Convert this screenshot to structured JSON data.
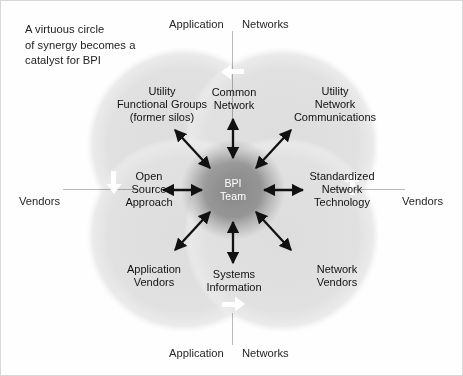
{
  "figure": {
    "caption_lines": [
      "A virtuous circle",
      "of synergy becomes a",
      "catalyst for BPI"
    ],
    "center": {
      "line1": "BPI",
      "line2": "Team"
    },
    "axis_labels": {
      "top_left": "Application",
      "top_right": "Networks",
      "bottom_left": "Application",
      "bottom_right": "Networks",
      "left": "Vendors",
      "right": "Vendors"
    },
    "nodes": [
      {
        "id": "utility-functional-groups",
        "lines": [
          "Utility",
          "Functional Groups",
          "(former silos)"
        ]
      },
      {
        "id": "common-network",
        "lines": [
          "Common",
          "Network"
        ]
      },
      {
        "id": "utility-network-communications",
        "lines": [
          "Utility",
          "Network",
          "Communications"
        ]
      },
      {
        "id": "open-source-approach",
        "lines": [
          "Open",
          "Source",
          "Approach"
        ]
      },
      {
        "id": "standardized-network-technology",
        "lines": [
          "Standardized",
          "Network",
          "Technology"
        ]
      },
      {
        "id": "application-vendors",
        "lines": [
          "Application",
          "Vendors"
        ]
      },
      {
        "id": "systems-information",
        "lines": [
          "Systems",
          "Information"
        ]
      },
      {
        "id": "network-vendors",
        "lines": [
          "Network",
          "Vendors"
        ]
      }
    ],
    "circulation_arrows": [
      {
        "id": "top",
        "direction": "left"
      },
      {
        "id": "right",
        "direction": "up"
      },
      {
        "id": "bottom",
        "direction": "right"
      },
      {
        "id": "left",
        "direction": "down"
      }
    ],
    "colors": {
      "background": "#ffffff",
      "circle_fill": "#e3e3e3",
      "overlap_fill": "#c9c9c9",
      "center_fill": "#9e9e9e",
      "arrow": "#111111",
      "circulation_arrow": "#ffffff",
      "axis_line": "#b9b9b9",
      "text": "#1a1a1a",
      "center_text": "#ffffff"
    }
  }
}
